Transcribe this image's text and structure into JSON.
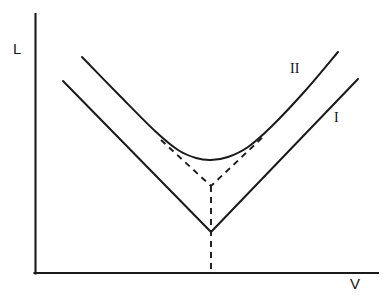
{
  "figure": {
    "title": "",
    "background_color": "#ffffff",
    "ink_color": "#1a1a1a",
    "width": 388,
    "height": 297
  },
  "axes": {
    "y_axis": {
      "label": "L",
      "x": 35,
      "y_top": 14,
      "y_bottom": 273
    },
    "x_axis": {
      "label": "V",
      "y": 273,
      "x_left": 35,
      "x_right": 378
    },
    "ticks": [],
    "tick_labels": [],
    "grid": false
  },
  "labels": {
    "y_axis_label": "L",
    "x_axis_label": "V",
    "curve_upper": "II",
    "curve_lower": "I"
  },
  "chart_data": {
    "type": "line",
    "title": "",
    "xlabel": "V",
    "ylabel": "L",
    "grid": false,
    "legend_position": "inline-right",
    "xlim": [
      35,
      378
    ],
    "ylim": [
      273,
      14
    ],
    "note": "Axis values are unlabeled; coordinates are given in screenshot pixel space with y increasing downward.",
    "series": [
      {
        "name": "I",
        "label": "I",
        "style": "solid",
        "shape": "v-shaped-kink",
        "description": "Lower solid curve with a sharp V vertex",
        "points": [
          [
            63,
            81
          ],
          [
            211,
            232
          ],
          [
            358,
            79
          ]
        ],
        "vertex": [
          211,
          232
        ],
        "label_position": [
          334,
          111
        ]
      },
      {
        "name": "II",
        "label": "II",
        "style": "solid",
        "shape": "smooth-u",
        "description": "Upper solid curve, rounded minimum (avoided crossing)",
        "points": [
          [
            82,
            57
          ],
          [
            120,
            96
          ],
          [
            155,
            131
          ],
          [
            178,
            150
          ],
          [
            196,
            158
          ],
          [
            211,
            160
          ],
          [
            228,
            157
          ],
          [
            248,
            147
          ],
          [
            272,
            126
          ],
          [
            305,
            91
          ],
          [
            338,
            52
          ]
        ],
        "minimum": [
          211,
          160
        ],
        "label_position": [
          290,
          62
        ]
      },
      {
        "name": "asymptote-v",
        "label": "",
        "style": "dashed",
        "shape": "v-shaped-kink",
        "description": "Dashed V showing the unperturbed crossing branches of curve II",
        "points": [
          [
            161,
            140
          ],
          [
            211,
            186
          ],
          [
            264,
            136
          ]
        ],
        "vertex": [
          211,
          186
        ],
        "label_position": null
      },
      {
        "name": "crossing-marker",
        "label": "",
        "style": "dashed",
        "shape": "vertical-line",
        "description": "Vertical dashed line from the dashed V vertex down to the V axis",
        "points": [
          [
            211,
            186
          ],
          [
            211,
            273
          ]
        ],
        "label_position": null
      }
    ]
  }
}
